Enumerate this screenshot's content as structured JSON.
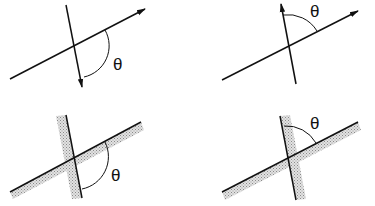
{
  "diagram": {
    "panels": [
      {
        "id": "top-left",
        "angle_label": "θ",
        "type": "vector-arrows",
        "arc": "between rightward line and downward arrow"
      },
      {
        "id": "top-right",
        "angle_label": "θ",
        "type": "vector-arrows",
        "arc": "between upward arrow and rightward line"
      },
      {
        "id": "bottom-left",
        "angle_label": "θ",
        "type": "shaded-surfaces",
        "arc": "below line, between surface and downward line"
      },
      {
        "id": "bottom-right",
        "angle_label": "θ",
        "type": "shaded-surfaces",
        "arc": "above line, between upward line and surface"
      }
    ],
    "colors": {
      "line": "#111111",
      "shade": "#bdbdbd",
      "background": "#ffffff"
    }
  }
}
